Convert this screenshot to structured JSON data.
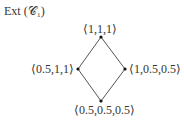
{
  "title": "Ext (𝒞₁)",
  "nodes": [
    {
      "id": "top",
      "label": "⟨1,1,1⟩"
    },
    {
      "id": "left",
      "label": "⟨0.5,1,1⟩"
    },
    {
      "id": "right",
      "label": "⟨1,0.5,0.5⟩"
    },
    {
      "id": "bottom",
      "label": "⟨0.5,0.5,0.5⟩"
    }
  ],
  "edges": [
    [
      "top",
      "left"
    ],
    [
      "top",
      "right"
    ],
    [
      "left",
      "bottom"
    ],
    [
      "right",
      "bottom"
    ]
  ]
}
